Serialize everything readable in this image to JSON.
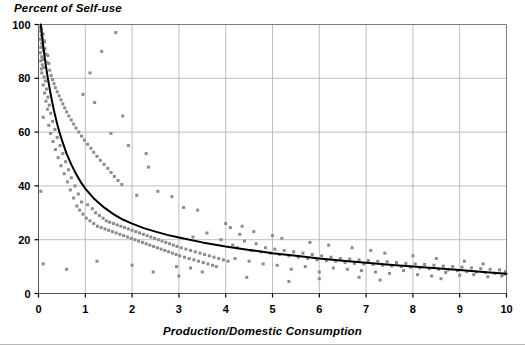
{
  "chart_data": {
    "type": "scatter",
    "title": "Percent of Self-use",
    "xlabel": "Production/Domestic Consumption",
    "ylabel": "Percent of Self-use",
    "xlim": [
      0,
      10
    ],
    "ylim": [
      0,
      100
    ],
    "xticks": [
      0,
      1,
      2,
      3,
      4,
      5,
      6,
      7,
      8,
      9,
      10
    ],
    "yticks": [
      0,
      20,
      40,
      60,
      80,
      100
    ],
    "xtick_labels": [
      "0",
      "1",
      "2",
      "3",
      "4",
      "5",
      "6",
      "7",
      "8",
      "9",
      "10"
    ],
    "ytick_labels": [
      "0",
      "20",
      "40",
      "60",
      "80",
      "100"
    ],
    "grid": true,
    "legend": "none",
    "marker": "square",
    "marker_color": "#8c8c8c",
    "marker_size": 3,
    "trendline": {
      "name": "fitted decay curve",
      "color": "#000000",
      "width": 2,
      "description": "monotone decreasing hyperbolic fit from ~100 at x=0.05 to ~7 at x=10",
      "points": [
        [
          0.05,
          100.0
        ],
        [
          0.1,
          92.0
        ],
        [
          0.15,
          85.5
        ],
        [
          0.2,
          80.0
        ],
        [
          0.25,
          75.0
        ],
        [
          0.3,
          70.5
        ],
        [
          0.35,
          66.5
        ],
        [
          0.4,
          63.0
        ],
        [
          0.45,
          59.8
        ],
        [
          0.5,
          57.0
        ],
        [
          0.6,
          52.0
        ],
        [
          0.7,
          48.0
        ],
        [
          0.8,
          44.5
        ],
        [
          0.9,
          41.5
        ],
        [
          1.0,
          39.0
        ],
        [
          1.2,
          35.0
        ],
        [
          1.4,
          32.0
        ],
        [
          1.6,
          29.5
        ],
        [
          1.8,
          27.5
        ],
        [
          2.0,
          26.0
        ],
        [
          2.25,
          24.3
        ],
        [
          2.5,
          23.0
        ],
        [
          2.75,
          21.8
        ],
        [
          3.0,
          20.8
        ],
        [
          3.5,
          19.0
        ],
        [
          4.0,
          17.5
        ],
        [
          4.5,
          16.2
        ],
        [
          5.0,
          15.0
        ],
        [
          5.5,
          14.0
        ],
        [
          6.0,
          13.0
        ],
        [
          6.5,
          12.2
        ],
        [
          7.0,
          11.4
        ],
        [
          7.5,
          10.7
        ],
        [
          8.0,
          10.0
        ],
        [
          8.5,
          9.4
        ],
        [
          9.0,
          8.7
        ],
        [
          9.5,
          8.0
        ],
        [
          10.0,
          7.3
        ]
      ]
    },
    "points": [
      [
        0.03,
        99.0
      ],
      [
        0.05,
        97.5
      ],
      [
        0.06,
        96.0
      ],
      [
        0.04,
        94.5
      ],
      [
        0.07,
        93.0
      ],
      [
        0.05,
        91.5
      ],
      [
        0.08,
        95.0
      ],
      [
        0.06,
        98.5
      ],
      [
        0.09,
        92.0
      ],
      [
        0.04,
        89.5
      ],
      [
        0.1,
        96.5
      ],
      [
        0.07,
        88.0
      ],
      [
        0.12,
        94.0
      ],
      [
        0.05,
        86.5
      ],
      [
        0.11,
        90.5
      ],
      [
        0.08,
        85.0
      ],
      [
        0.13,
        93.5
      ],
      [
        0.06,
        83.5
      ],
      [
        0.14,
        91.0
      ],
      [
        0.09,
        87.0
      ],
      [
        0.16,
        89.0
      ],
      [
        0.11,
        84.0
      ],
      [
        0.18,
        86.0
      ],
      [
        0.07,
        82.0
      ],
      [
        0.2,
        88.5
      ],
      [
        0.12,
        80.5
      ],
      [
        0.22,
        85.5
      ],
      [
        0.15,
        79.0
      ],
      [
        0.24,
        83.0
      ],
      [
        0.1,
        77.5
      ],
      [
        0.27,
        81.0
      ],
      [
        0.17,
        76.0
      ],
      [
        0.3,
        79.5
      ],
      [
        0.13,
        74.5
      ],
      [
        0.33,
        78.0
      ],
      [
        0.2,
        73.0
      ],
      [
        0.36,
        76.5
      ],
      [
        0.16,
        71.5
      ],
      [
        0.4,
        75.0
      ],
      [
        0.23,
        70.0
      ],
      [
        0.44,
        73.5
      ],
      [
        0.19,
        68.5
      ],
      [
        0.48,
        72.0
      ],
      [
        0.26,
        67.0
      ],
      [
        0.52,
        70.5
      ],
      [
        0.1,
        65.5
      ],
      [
        0.3,
        64.0
      ],
      [
        0.56,
        69.0
      ],
      [
        0.22,
        62.5
      ],
      [
        0.6,
        67.5
      ],
      [
        0.35,
        61.0
      ],
      [
        0.65,
        66.0
      ],
      [
        0.26,
        59.5
      ],
      [
        0.7,
        64.5
      ],
      [
        0.4,
        58.0
      ],
      [
        0.75,
        63.0
      ],
      [
        0.31,
        56.5
      ],
      [
        0.8,
        61.5
      ],
      [
        0.46,
        55.0
      ],
      [
        0.86,
        60.0
      ],
      [
        0.36,
        53.5
      ],
      [
        0.92,
        58.5
      ],
      [
        0.52,
        52.0
      ],
      [
        0.98,
        57.0
      ],
      [
        0.42,
        50.5
      ],
      [
        1.05,
        55.5
      ],
      [
        0.58,
        49.0
      ],
      [
        1.12,
        54.0
      ],
      [
        0.48,
        47.5
      ],
      [
        1.18,
        52.5
      ],
      [
        0.64,
        46.0
      ],
      [
        1.25,
        51.0
      ],
      [
        0.55,
        44.5
      ],
      [
        1.32,
        49.5
      ],
      [
        0.7,
        43.0
      ],
      [
        1.4,
        48.0
      ],
      [
        0.62,
        41.5
      ],
      [
        1.48,
        46.5
      ],
      [
        0.78,
        40.0
      ],
      [
        1.55,
        45.0
      ],
      [
        0.68,
        38.5
      ],
      [
        1.62,
        43.5
      ],
      [
        0.85,
        37.0
      ],
      [
        1.7,
        42.0
      ],
      [
        0.75,
        35.5
      ],
      [
        0.05,
        38.0
      ],
      [
        0.92,
        34.0
      ],
      [
        1.78,
        40.5
      ],
      [
        0.82,
        32.5
      ],
      [
        1.05,
        33.0
      ],
      [
        0.88,
        31.0
      ],
      [
        1.15,
        31.5
      ],
      [
        0.95,
        29.5
      ],
      [
        1.22,
        30.0
      ],
      [
        1.02,
        28.0
      ],
      [
        1.3,
        29.0
      ],
      [
        1.1,
        27.0
      ],
      [
        1.38,
        28.0
      ],
      [
        1.18,
        26.0
      ],
      [
        1.45,
        27.0
      ],
      [
        1.26,
        25.0
      ],
      [
        1.52,
        26.5
      ],
      [
        1.34,
        24.5
      ],
      [
        1.6,
        26.0
      ],
      [
        1.42,
        24.0
      ],
      [
        1.68,
        25.5
      ],
      [
        1.5,
        23.5
      ],
      [
        1.76,
        25.0
      ],
      [
        1.58,
        23.0
      ],
      [
        1.84,
        24.5
      ],
      [
        1.66,
        22.5
      ],
      [
        1.92,
        24.0
      ],
      [
        1.74,
        22.0
      ],
      [
        2.0,
        23.5
      ],
      [
        1.82,
        21.5
      ],
      [
        2.08,
        23.0
      ],
      [
        1.9,
        21.0
      ],
      [
        2.16,
        22.5
      ],
      [
        1.98,
        20.5
      ],
      [
        2.24,
        22.0
      ],
      [
        2.06,
        20.0
      ],
      [
        2.32,
        21.5
      ],
      [
        2.14,
        19.5
      ],
      [
        2.4,
        21.0
      ],
      [
        2.22,
        19.0
      ],
      [
        2.48,
        20.5
      ],
      [
        2.3,
        18.5
      ],
      [
        2.56,
        20.0
      ],
      [
        2.38,
        18.0
      ],
      [
        2.64,
        19.5
      ],
      [
        2.46,
        17.5
      ],
      [
        2.72,
        19.0
      ],
      [
        2.54,
        17.0
      ],
      [
        2.8,
        18.5
      ],
      [
        2.62,
        16.5
      ],
      [
        2.88,
        18.0
      ],
      [
        2.7,
        16.0
      ],
      [
        2.96,
        17.5
      ],
      [
        2.78,
        15.5
      ],
      [
        3.05,
        17.0
      ],
      [
        2.86,
        15.0
      ],
      [
        3.15,
        16.5
      ],
      [
        2.94,
        14.5
      ],
      [
        3.25,
        16.0
      ],
      [
        3.02,
        14.0
      ],
      [
        3.35,
        15.5
      ],
      [
        3.12,
        13.5
      ],
      [
        3.45,
        15.0
      ],
      [
        3.22,
        13.0
      ],
      [
        3.55,
        14.5
      ],
      [
        3.32,
        12.5
      ],
      [
        3.65,
        14.0
      ],
      [
        3.42,
        12.0
      ],
      [
        3.75,
        13.5
      ],
      [
        3.52,
        11.5
      ],
      [
        3.85,
        13.0
      ],
      [
        3.62,
        11.0
      ],
      [
        3.95,
        12.5
      ],
      [
        3.72,
        10.5
      ],
      [
        4.05,
        12.0
      ],
      [
        1.65,
        97.0
      ],
      [
        1.35,
        90.0
      ],
      [
        1.1,
        82.0
      ],
      [
        1.8,
        66.0
      ],
      [
        1.55,
        59.5
      ],
      [
        2.3,
        52.0
      ],
      [
        2.35,
        47.0
      ],
      [
        1.92,
        55.0
      ],
      [
        1.2,
        71.0
      ],
      [
        0.95,
        74.0
      ],
      [
        2.1,
        36.5
      ],
      [
        2.55,
        38.0
      ],
      [
        2.85,
        36.0
      ],
      [
        3.1,
        32.0
      ],
      [
        3.4,
        31.0
      ],
      [
        2.0,
        10.5
      ],
      [
        2.45,
        8.0
      ],
      [
        1.25,
        12.0
      ],
      [
        0.6,
        9.0
      ],
      [
        0.1,
        11.0
      ],
      [
        3.3,
        21.0
      ],
      [
        3.6,
        22.5
      ],
      [
        3.9,
        20.0
      ],
      [
        4.1,
        24.5
      ],
      [
        4.3,
        22.0
      ],
      [
        4.15,
        18.0
      ],
      [
        4.25,
        17.0
      ],
      [
        4.4,
        19.5
      ],
      [
        4.55,
        16.0
      ],
      [
        4.65,
        18.5
      ],
      [
        4.75,
        15.5
      ],
      [
        4.85,
        17.0
      ],
      [
        4.95,
        15.0
      ],
      [
        5.05,
        16.5
      ],
      [
        5.15,
        14.5
      ],
      [
        5.25,
        16.0
      ],
      [
        5.35,
        14.0
      ],
      [
        5.45,
        15.5
      ],
      [
        5.55,
        13.5
      ],
      [
        5.65,
        15.0
      ],
      [
        5.75,
        13.0
      ],
      [
        5.85,
        14.5
      ],
      [
        5.95,
        12.5
      ],
      [
        6.05,
        14.0
      ],
      [
        6.15,
        12.2
      ],
      [
        6.25,
        13.5
      ],
      [
        6.35,
        12.0
      ],
      [
        6.45,
        13.0
      ],
      [
        6.55,
        11.5
      ],
      [
        6.65,
        12.8
      ],
      [
        6.75,
        11.2
      ],
      [
        6.85,
        12.5
      ],
      [
        6.95,
        11.0
      ],
      [
        7.05,
        12.2
      ],
      [
        7.15,
        10.8
      ],
      [
        7.25,
        12.0
      ],
      [
        7.35,
        10.5
      ],
      [
        7.45,
        11.8
      ],
      [
        7.55,
        10.2
      ],
      [
        7.65,
        11.5
      ],
      [
        7.75,
        10.0
      ],
      [
        7.85,
        11.2
      ],
      [
        7.95,
        9.8
      ],
      [
        8.05,
        11.0
      ],
      [
        8.15,
        9.5
      ],
      [
        8.25,
        10.8
      ],
      [
        8.35,
        9.2
      ],
      [
        8.45,
        10.5
      ],
      [
        8.55,
        9.0
      ],
      [
        8.65,
        10.2
      ],
      [
        8.75,
        8.8
      ],
      [
        8.85,
        10.0
      ],
      [
        8.95,
        8.5
      ],
      [
        9.05,
        9.8
      ],
      [
        9.15,
        8.2
      ],
      [
        9.25,
        9.5
      ],
      [
        9.35,
        8.0
      ],
      [
        9.45,
        9.2
      ],
      [
        9.55,
        7.8
      ],
      [
        9.65,
        9.0
      ],
      [
        9.75,
        7.5
      ],
      [
        9.85,
        8.8
      ],
      [
        9.95,
        7.2
      ],
      [
        9.98,
        8.2
      ],
      [
        4.2,
        13.0
      ],
      [
        4.5,
        12.0
      ],
      [
        4.8,
        11.0
      ],
      [
        5.1,
        10.5
      ],
      [
        5.4,
        9.0
      ],
      [
        5.7,
        10.0
      ],
      [
        6.0,
        8.0
      ],
      [
        6.3,
        9.5
      ],
      [
        6.6,
        9.0
      ],
      [
        6.9,
        8.5
      ],
      [
        7.2,
        8.0
      ],
      [
        7.5,
        7.5
      ],
      [
        7.8,
        8.5
      ],
      [
        8.1,
        7.0
      ],
      [
        8.4,
        6.5
      ],
      [
        8.7,
        7.8
      ],
      [
        9.0,
        6.8
      ],
      [
        9.3,
        7.0
      ],
      [
        9.6,
        6.2
      ],
      [
        9.9,
        6.5
      ],
      [
        4.35,
        25.0
      ],
      [
        4.6,
        23.0
      ],
      [
        4.0,
        26.0
      ],
      [
        5.2,
        20.5
      ],
      [
        5.0,
        21.5
      ],
      [
        5.8,
        19.0
      ],
      [
        6.2,
        18.0
      ],
      [
        6.7,
        17.0
      ],
      [
        7.1,
        16.0
      ],
      [
        7.4,
        15.0
      ],
      [
        8.0,
        14.0
      ],
      [
        8.5,
        13.0
      ],
      [
        9.1,
        12.0
      ],
      [
        9.5,
        11.0
      ],
      [
        4.45,
        6.0
      ],
      [
        5.35,
        4.5
      ],
      [
        6.0,
        5.5
      ],
      [
        6.85,
        6.0
      ],
      [
        7.3,
        5.0
      ],
      [
        8.6,
        5.5
      ],
      [
        3.25,
        9.5
      ],
      [
        3.5,
        8.0
      ],
      [
        3.8,
        10.0
      ],
      [
        2.95,
        10.0
      ],
      [
        3.0,
        6.5
      ]
    ]
  }
}
